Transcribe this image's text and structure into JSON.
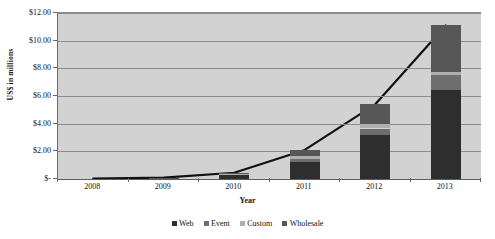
{
  "chart_data": {
    "type": "bar",
    "stacked": true,
    "title": "",
    "xlabel": "Year",
    "ylabel": "US$ in millions",
    "categories": [
      "2008",
      "2009",
      "2010",
      "2011",
      "2012",
      "2013"
    ],
    "series": [
      {
        "name": "Web",
        "color": "#2e2e2e",
        "values": [
          0.02,
          0.05,
          0.3,
          1.2,
          3.2,
          6.4
        ]
      },
      {
        "name": "Event",
        "color": "#6e6e6e",
        "values": [
          0.0,
          0.01,
          0.05,
          0.25,
          0.45,
          1.1
        ]
      },
      {
        "name": "Custom",
        "color": "#aeaeae",
        "values": [
          0.0,
          0.01,
          0.03,
          0.2,
          0.3,
          0.2
        ]
      },
      {
        "name": "Wholesale",
        "color": "#575757",
        "values": [
          0.01,
          0.03,
          0.07,
          0.45,
          1.45,
          3.4
        ]
      }
    ],
    "totals": [
      0.03,
      0.1,
      0.45,
      2.1,
      5.4,
      11.1
    ],
    "line_series": {
      "name": "Total",
      "color": "#111111",
      "values": [
        0.03,
        0.1,
        0.45,
        2.1,
        5.4,
        11.1
      ]
    },
    "ylim": [
      0,
      12
    ],
    "yticks": [
      0,
      2,
      4,
      6,
      8,
      10,
      12
    ],
    "ytick_labels": [
      "$-",
      "$2.00",
      "$4.00",
      "$6.00",
      "$8.00",
      "$10.00",
      "$12.00"
    ],
    "grid": true,
    "legend_position": "bottom",
    "plot_background": "#d2d2d2"
  },
  "legend": {
    "items": [
      {
        "label": "Web"
      },
      {
        "label": "Event"
      },
      {
        "label": "Custom"
      },
      {
        "label": "Wholesale"
      }
    ]
  },
  "header": {
    "title_remnant": ""
  }
}
